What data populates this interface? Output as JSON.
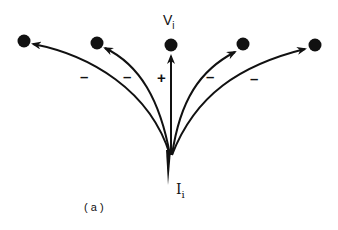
{
  "diagram": {
    "top_label": "V",
    "top_label_sub": "i",
    "bottom_label": "I",
    "bottom_label_sub": "i",
    "caption": "( a )",
    "signs": [
      "–",
      "–",
      "+",
      "–",
      "–"
    ],
    "nodes": [
      "node-1",
      "node-2",
      "node-3",
      "node-4",
      "node-5"
    ],
    "colors": {
      "ink": "#111111",
      "background": "#ffffff"
    }
  }
}
